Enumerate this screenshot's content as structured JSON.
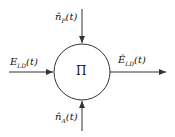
{
  "diagram": {
    "node": {
      "label": "Π",
      "shape": "circle"
    },
    "inputs": [
      {
        "id": "top",
        "label": "n̂P(t)",
        "base": "n̂",
        "sub": "P",
        "arg": "(t)",
        "direction": "down"
      },
      {
        "id": "left",
        "label": "ELD(t)",
        "base": "E",
        "sub": "LD",
        "arg": "(t)",
        "direction": "right"
      },
      {
        "id": "bottom",
        "label": "n̂A(t)",
        "base": "n̂",
        "sub": "A",
        "arg": "(t)",
        "direction": "up"
      }
    ],
    "output": {
      "id": "right",
      "label": "ÊLD(t)",
      "base": "Ê",
      "sub": "LD",
      "arg": "(t)",
      "direction": "right"
    },
    "colors": {
      "stroke": "#333333",
      "background": "#ffffff"
    }
  }
}
